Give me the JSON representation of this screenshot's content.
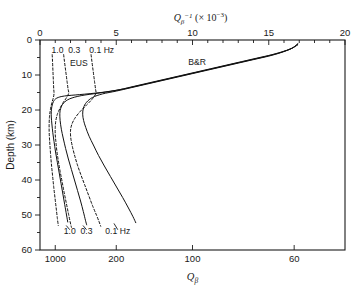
{
  "chart_data": {
    "type": "line",
    "title": "",
    "top_axis": {
      "label": "Qβ⁻¹ (× 10⁻³)",
      "label_parts": {
        "q": "Q",
        "sub": "β",
        "sup": "-1",
        "rest": "(× 10",
        "rest_sup": "−3",
        "rest_end": ")"
      },
      "ticks": [
        0,
        5,
        10,
        15,
        20
      ],
      "tick_labels": [
        "0",
        "5",
        "10",
        "15",
        "20"
      ],
      "minor_tick_step": 1,
      "range": [
        0,
        20
      ]
    },
    "bottom_axis": {
      "label": "Qβ",
      "label_parts": {
        "q": "Q",
        "sub": "β"
      },
      "tick_values_q": [
        1000,
        200,
        100,
        60
      ],
      "tick_labels": [
        "1000",
        "200",
        "100",
        "60"
      ],
      "tick_positions_qinv": [
        1.0,
        5.0,
        10.0,
        16.667
      ],
      "note": "reciprocal of top axis, x1000"
    },
    "y_axis": {
      "label": "Depth (km)",
      "ticks": [
        0,
        10,
        20,
        30,
        40,
        50,
        60
      ],
      "tick_labels": [
        "0",
        "10",
        "20",
        "30",
        "40",
        "50",
        "60"
      ],
      "minor_tick_step": 5,
      "range": [
        0,
        60
      ],
      "direction": "inverted"
    },
    "grid": false,
    "legend_position": "inline-annotations",
    "annotations": [
      {
        "text": "1.0",
        "x": 1.15,
        "y": 3.6,
        "name": "eus-1.0-top"
      },
      {
        "text": "0.3",
        "x": 2.25,
        "y": 3.6,
        "name": "eus-0.3-top"
      },
      {
        "text": "0.1 Hz",
        "x": 4.05,
        "y": 3.6,
        "name": "eus-0.1-top"
      },
      {
        "text": "EUS",
        "x": 2.55,
        "y": 7.4,
        "name": "eus-label"
      },
      {
        "text": "B&R",
        "x": 10.3,
        "y": 7.0,
        "name": "br-label"
      },
      {
        "text": "1.0",
        "x": 1.95,
        "y": 55.4,
        "name": "br-1.0-bottom"
      },
      {
        "text": "0.3",
        "x": 3.05,
        "y": 55.4,
        "name": "br-0.3-bottom"
      },
      {
        "text": "0.1 Hz",
        "x": 5.1,
        "y": 55.4,
        "name": "br-0.1-bottom"
      }
    ],
    "series": [
      {
        "name": "EUS 1.0 Hz",
        "region": "EUS",
        "frequency_hz": 1.0,
        "style": "dashed",
        "points": [
          [
            0.8,
            4.2
          ],
          [
            0.82,
            6.0
          ],
          [
            0.84,
            8.0
          ],
          [
            0.86,
            10.0
          ],
          [
            0.88,
            12.0
          ],
          [
            0.9,
            14.0
          ],
          [
            0.92,
            15.2
          ],
          [
            0.88,
            16.4
          ],
          [
            0.8,
            17.6
          ],
          [
            0.72,
            19.0
          ],
          [
            0.66,
            20.5
          ],
          [
            0.62,
            22.0
          ],
          [
            0.6,
            24.0
          ],
          [
            0.6,
            26.0
          ],
          [
            0.62,
            28.0
          ],
          [
            0.65,
            30.0
          ],
          [
            0.7,
            33.0
          ],
          [
            0.76,
            36.0
          ],
          [
            0.83,
            39.0
          ],
          [
            0.9,
            42.0
          ],
          [
            0.98,
            45.0
          ],
          [
            1.06,
            48.0
          ],
          [
            1.14,
            51.0
          ],
          [
            1.2,
            53.0
          ]
        ]
      },
      {
        "name": "EUS 0.3 Hz",
        "region": "EUS",
        "frequency_hz": 0.3,
        "style": "dashed",
        "points": [
          [
            1.55,
            4.2
          ],
          [
            1.6,
            6.0
          ],
          [
            1.66,
            8.0
          ],
          [
            1.72,
            10.0
          ],
          [
            1.78,
            12.0
          ],
          [
            1.84,
            14.0
          ],
          [
            1.88,
            15.2
          ],
          [
            1.72,
            16.6
          ],
          [
            1.5,
            18.0
          ],
          [
            1.3,
            19.6
          ],
          [
            1.14,
            21.2
          ],
          [
            1.04,
            23.0
          ],
          [
            1.0,
            25.0
          ],
          [
            1.0,
            27.0
          ],
          [
            1.04,
            29.0
          ],
          [
            1.1,
            31.5
          ],
          [
            1.2,
            34.5
          ],
          [
            1.32,
            37.5
          ],
          [
            1.45,
            40.5
          ],
          [
            1.58,
            43.5
          ],
          [
            1.72,
            46.5
          ],
          [
            1.86,
            49.5
          ],
          [
            1.98,
            52.0
          ],
          [
            2.06,
            53.5
          ]
        ]
      },
      {
        "name": "EUS 0.1 Hz",
        "region": "EUS",
        "frequency_hz": 0.1,
        "style": "dashed",
        "points": [
          [
            3.35,
            4.2
          ],
          [
            3.4,
            6.0
          ],
          [
            3.46,
            8.0
          ],
          [
            3.52,
            10.0
          ],
          [
            3.58,
            12.0
          ],
          [
            3.64,
            14.0
          ],
          [
            3.66,
            15.3
          ],
          [
            3.4,
            17.0
          ],
          [
            3.0,
            18.8
          ],
          [
            2.6,
            20.6
          ],
          [
            2.28,
            22.4
          ],
          [
            2.08,
            24.2
          ],
          [
            2.0,
            26.0
          ],
          [
            2.02,
            28.0
          ],
          [
            2.1,
            30.0
          ],
          [
            2.24,
            32.5
          ],
          [
            2.44,
            35.5
          ],
          [
            2.68,
            38.5
          ],
          [
            2.94,
            41.5
          ],
          [
            3.2,
            44.5
          ],
          [
            3.46,
            47.5
          ],
          [
            3.7,
            50.0
          ],
          [
            3.88,
            52.0
          ],
          [
            3.98,
            53.2
          ]
        ]
      },
      {
        "name": "B&R 1.0 Hz",
        "region": "B&R",
        "frequency_hz": 1.0,
        "style": "solid",
        "points": [
          [
            16.9,
            1.0
          ],
          [
            16.6,
            2.2
          ],
          [
            16.0,
            3.2
          ],
          [
            15.2,
            4.2
          ],
          [
            14.2,
            5.2
          ],
          [
            13.2,
            6.2
          ],
          [
            12.2,
            7.2
          ],
          [
            11.2,
            8.2
          ],
          [
            10.2,
            9.2
          ],
          [
            9.2,
            10.2
          ],
          [
            8.2,
            11.2
          ],
          [
            7.2,
            12.2
          ],
          [
            6.2,
            13.2
          ],
          [
            5.2,
            14.2
          ],
          [
            4.0,
            15.0
          ],
          [
            2.6,
            15.6
          ],
          [
            1.6,
            16.0
          ],
          [
            1.1,
            16.6
          ],
          [
            0.88,
            17.6
          ],
          [
            0.78,
            19.0
          ],
          [
            0.74,
            20.5
          ],
          [
            0.74,
            22.0
          ],
          [
            0.78,
            24.0
          ],
          [
            0.84,
            26.5
          ],
          [
            0.92,
            29.0
          ],
          [
            1.02,
            32.0
          ],
          [
            1.14,
            35.0
          ],
          [
            1.26,
            38.0
          ],
          [
            1.38,
            41.0
          ],
          [
            1.5,
            44.0
          ],
          [
            1.62,
            47.0
          ],
          [
            1.74,
            50.0
          ],
          [
            1.82,
            52.0
          ]
        ]
      },
      {
        "name": "B&R 0.3 Hz",
        "region": "B&R",
        "frequency_hz": 0.3,
        "style": "solid",
        "points": [
          [
            16.9,
            1.2
          ],
          [
            16.5,
            2.4
          ],
          [
            15.9,
            3.4
          ],
          [
            15.1,
            4.4
          ],
          [
            14.1,
            5.4
          ],
          [
            13.1,
            6.4
          ],
          [
            12.1,
            7.4
          ],
          [
            11.1,
            8.4
          ],
          [
            10.1,
            9.4
          ],
          [
            9.1,
            10.4
          ],
          [
            8.1,
            11.4
          ],
          [
            7.1,
            12.4
          ],
          [
            6.1,
            13.4
          ],
          [
            5.0,
            14.4
          ],
          [
            3.8,
            15.2
          ],
          [
            2.7,
            15.9
          ],
          [
            1.95,
            16.8
          ],
          [
            1.55,
            18.0
          ],
          [
            1.36,
            19.5
          ],
          [
            1.3,
            21.0
          ],
          [
            1.32,
            23.0
          ],
          [
            1.4,
            25.5
          ],
          [
            1.52,
            28.0
          ],
          [
            1.68,
            31.0
          ],
          [
            1.86,
            34.0
          ],
          [
            2.06,
            37.0
          ],
          [
            2.26,
            40.0
          ],
          [
            2.46,
            43.0
          ],
          [
            2.66,
            46.0
          ],
          [
            2.84,
            49.0
          ],
          [
            2.98,
            51.5
          ],
          [
            3.06,
            52.8
          ]
        ]
      },
      {
        "name": "B&R 0.1 Hz",
        "region": "B&R",
        "frequency_hz": 0.1,
        "style": "solid",
        "points": [
          [
            16.9,
            1.4
          ],
          [
            16.4,
            2.6
          ],
          [
            15.8,
            3.6
          ],
          [
            15.0,
            4.6
          ],
          [
            14.0,
            5.6
          ],
          [
            13.0,
            6.6
          ],
          [
            12.0,
            7.6
          ],
          [
            11.0,
            8.6
          ],
          [
            10.0,
            9.6
          ],
          [
            9.0,
            10.6
          ],
          [
            8.0,
            11.6
          ],
          [
            7.0,
            12.6
          ],
          [
            6.0,
            13.6
          ],
          [
            5.0,
            14.6
          ],
          [
            4.1,
            15.4
          ],
          [
            3.45,
            16.4
          ],
          [
            3.05,
            17.8
          ],
          [
            2.85,
            19.4
          ],
          [
            2.8,
            21.2
          ],
          [
            2.86,
            23.0
          ],
          [
            3.0,
            25.0
          ],
          [
            3.22,
            27.5
          ],
          [
            3.5,
            30.0
          ],
          [
            3.84,
            33.0
          ],
          [
            4.22,
            36.0
          ],
          [
            4.62,
            39.0
          ],
          [
            5.02,
            42.0
          ],
          [
            5.42,
            45.0
          ],
          [
            5.8,
            48.0
          ],
          [
            6.1,
            50.5
          ],
          [
            6.28,
            52.2
          ]
        ]
      }
    ]
  }
}
